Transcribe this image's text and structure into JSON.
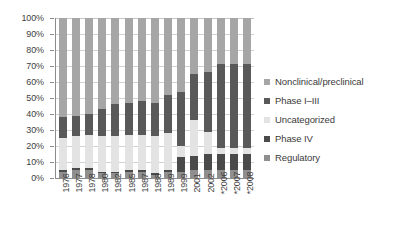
{
  "chart_data": {
    "type": "bar",
    "subtype": "100% stacked column",
    "title": "",
    "xlabel": "",
    "ylabel": "",
    "ylim": [
      0,
      100
    ],
    "ytick_labels": [
      "100%",
      "90%",
      "80%",
      "70%",
      "60%",
      "50%",
      "40%",
      "30%",
      "20%",
      "10%",
      "0%"
    ],
    "ytick_values": [
      100,
      90,
      80,
      70,
      60,
      50,
      40,
      30,
      20,
      10,
      0
    ],
    "grid": true,
    "legend_position": "right",
    "categories": [
      "1976",
      "1977",
      "1978",
      "1980",
      "1982",
      "1985",
      "1987",
      "1988",
      "1989",
      "1999",
      "2001",
      "2002",
      "*2006",
      "*2007",
      "*2008"
    ],
    "stack_order_bottom_to_top": [
      "Regulatory",
      "Phase IV",
      "Uncategorized",
      "Phase I–III",
      "Nonclinical/preclinical"
    ],
    "series": [
      {
        "name": "Regulatory",
        "color": "#8f8f8f",
        "values": [
          4,
          5,
          5,
          3,
          3,
          4,
          4,
          2,
          4,
          4,
          5,
          5,
          5,
          5,
          5
        ]
      },
      {
        "name": "Phase IV",
        "color": "#4a4a4a",
        "values": [
          1,
          1,
          1,
          1,
          1,
          1,
          1,
          1,
          1,
          9,
          9,
          10,
          10,
          10,
          10
        ]
      },
      {
        "name": "Uncategorized",
        "color": "#e3e3e3",
        "values": [
          20,
          20,
          21,
          22,
          22,
          22,
          22,
          23,
          23,
          7,
          22,
          14,
          4,
          4,
          4
        ]
      },
      {
        "name": "Phase I–III",
        "color": "#595959",
        "values": [
          13,
          13,
          13,
          17,
          20,
          20,
          21,
          21,
          24,
          34,
          29,
          37,
          52,
          52,
          52
        ]
      },
      {
        "name": "Nonclinical/preclinical",
        "color": "#a6a6a6",
        "values": [
          62,
          61,
          60,
          57,
          54,
          53,
          52,
          53,
          48,
          46,
          35,
          34,
          29,
          29,
          29
        ]
      }
    ],
    "legend_entries": [
      {
        "label": "Nonclinical/preclinical",
        "color": "#a6a6a6"
      },
      {
        "label": "Phase I–III",
        "color": "#595959"
      },
      {
        "label": "Uncategorized",
        "color": "#e3e3e3"
      },
      {
        "label": "Phase IV",
        "color": "#4a4a4a"
      },
      {
        "label": "Regulatory",
        "color": "#8f8f8f"
      }
    ]
  }
}
